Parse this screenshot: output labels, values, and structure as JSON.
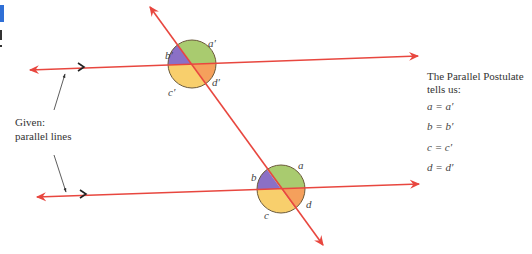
{
  "figure": {
    "colors": {
      "line": "#e8473f",
      "chevron": "#222222",
      "leader": "#333333",
      "circle_outline": "#6b5a3a",
      "sector_a": "#a9cb6f",
      "sector_b": "#8b70c6",
      "sector_c": "#f8cf6c",
      "sector_d": "#f5a05c",
      "edge_fragment_blue": "#2f6fd6"
    },
    "upper_intersection": {
      "labels": {
        "a": "a′",
        "b": "b′",
        "c": "c′",
        "d": "d′"
      }
    },
    "lower_intersection": {
      "labels": {
        "a": "a",
        "b": "b",
        "c": "c",
        "d": "d"
      }
    },
    "given_annotation": {
      "line1": "Given:",
      "line2": "parallel lines"
    },
    "postulate_note": {
      "line1": "The Parallel Postulate",
      "line2": "tells us:",
      "equations": [
        "a = a′",
        "b = b′",
        "c = c′",
        "d = d′"
      ]
    }
  }
}
